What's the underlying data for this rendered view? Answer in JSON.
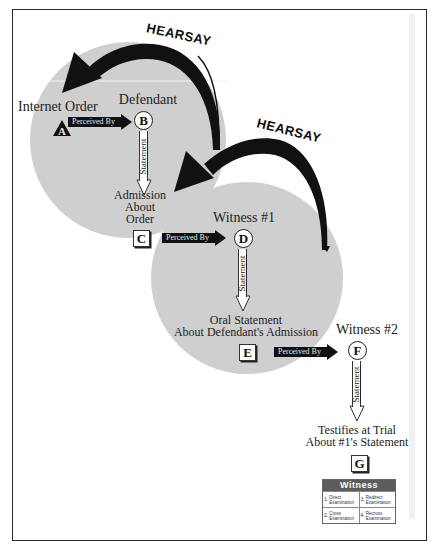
{
  "diagram": {
    "colors": {
      "circle_fill": "#cfcfcf",
      "arrow_fill": "#111111",
      "frame": "#2a2a2a",
      "table_header": "#5c5c5c"
    },
    "hearsay_labels": [
      "HEARSAY",
      "HEARSAY"
    ],
    "nodes": {
      "A": {
        "letter": "A",
        "shape": "triangle",
        "label": "Internet Order"
      },
      "B": {
        "letter": "B",
        "shape": "circle",
        "label": "Defendant"
      },
      "C": {
        "letter": "C",
        "shape": "box",
        "label_lines": [
          "Admission",
          "About",
          "Order"
        ]
      },
      "D": {
        "letter": "D",
        "shape": "circle",
        "label": "Witness #1"
      },
      "E": {
        "letter": "E",
        "shape": "box",
        "label_lines": [
          "Oral Statement",
          "About Defendant's Admission"
        ]
      },
      "F": {
        "letter": "F",
        "shape": "circle",
        "label": "Witness #2"
      },
      "G": {
        "letter": "G",
        "shape": "box",
        "label_lines": [
          "Testifies at Trial",
          "About #1's Statement"
        ]
      }
    },
    "edges": [
      {
        "from": "A",
        "to": "B",
        "label": "Perceived By"
      },
      {
        "from": "B",
        "to": "C",
        "label": "Statement"
      },
      {
        "from": "C",
        "to": "D",
        "label": "Perceived By"
      },
      {
        "from": "D",
        "to": "E",
        "label": "Statement"
      },
      {
        "from": "E",
        "to": "F",
        "label": "Perceived By"
      },
      {
        "from": "F",
        "to": "G",
        "label": "Statement"
      }
    ],
    "witness_table": {
      "header": "Witness",
      "cells": [
        {
          "num": "1.",
          "text_lines": [
            "Direct",
            "Examination"
          ]
        },
        {
          "num": "3.",
          "text_lines": [
            "Redirect",
            "Examination"
          ]
        },
        {
          "num": "2.",
          "text_lines": [
            "Cross",
            "Examination"
          ]
        },
        {
          "num": "4.",
          "text_lines": [
            "Recross",
            "Examination"
          ]
        }
      ]
    }
  }
}
